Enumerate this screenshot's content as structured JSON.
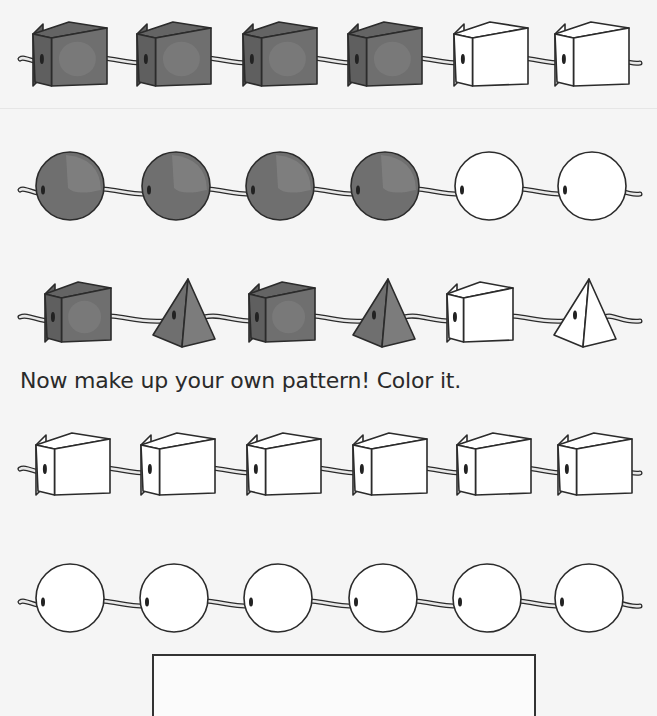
{
  "worksheet": {
    "instruction": "Now make up your own pattern! Color it.",
    "colors": {
      "background": "#f5f5f5",
      "filled_bead": "#6f6f6f",
      "filled_bead_light": "#858585",
      "empty_bead": "#ffffff",
      "outline": "#2b2b2b",
      "string": "#9a9a9a"
    },
    "rows": [
      {
        "id": "row-1",
        "beads": [
          "cube-filled",
          "cube-filled",
          "cube-filled",
          "cube-filled",
          "cube-empty",
          "cube-empty"
        ]
      },
      {
        "id": "row-2",
        "beads": [
          "sphere-filled",
          "sphere-filled",
          "sphere-filled",
          "sphere-filled",
          "sphere-empty",
          "sphere-empty"
        ]
      },
      {
        "id": "row-3",
        "beads": [
          "cube-filled",
          "pyramid-filled",
          "cube-filled",
          "pyramid-filled",
          "cube-empty",
          "pyramid-empty"
        ]
      },
      {
        "id": "row-4",
        "beads": [
          "cube-empty",
          "cube-empty",
          "cube-empty",
          "cube-empty",
          "cube-empty",
          "cube-empty"
        ]
      },
      {
        "id": "row-5",
        "beads": [
          "sphere-empty",
          "sphere-empty",
          "sphere-empty",
          "sphere-empty",
          "sphere-empty",
          "sphere-empty"
        ]
      }
    ]
  }
}
